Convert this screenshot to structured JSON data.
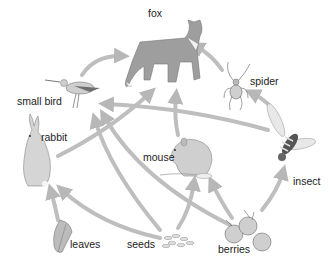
{
  "diagram": {
    "type": "food-web",
    "arrow_color": "#b4b4b4",
    "organism_fill": "#bdbdbd",
    "organisms": [
      {
        "id": "fox",
        "label": "fox",
        "role": "top predator"
      },
      {
        "id": "small_bird",
        "label": "small bird",
        "role": "consumer"
      },
      {
        "id": "spider",
        "label": "spider",
        "role": "consumer"
      },
      {
        "id": "rabbit",
        "label": "rabbit",
        "role": "herbivore"
      },
      {
        "id": "mouse",
        "label": "mouse",
        "role": "consumer"
      },
      {
        "id": "insect",
        "label": "insect",
        "role": "herbivore"
      },
      {
        "id": "leaves",
        "label": "leaves",
        "role": "producer"
      },
      {
        "id": "seeds",
        "label": "seeds",
        "role": "producer"
      },
      {
        "id": "berries",
        "label": "berries",
        "role": "producer"
      }
    ],
    "edges": [
      {
        "from": "small_bird",
        "to": "fox"
      },
      {
        "from": "spider",
        "to": "fox"
      },
      {
        "from": "rabbit",
        "to": "fox"
      },
      {
        "from": "mouse",
        "to": "fox"
      },
      {
        "from": "insect",
        "to": "spider"
      },
      {
        "from": "insect",
        "to": "small_bird"
      },
      {
        "from": "seeds",
        "to": "small_bird"
      },
      {
        "from": "berries",
        "to": "small_bird"
      },
      {
        "from": "leaves",
        "to": "rabbit"
      },
      {
        "from": "seeds",
        "to": "rabbit"
      },
      {
        "from": "seeds",
        "to": "mouse"
      },
      {
        "from": "berries",
        "to": "mouse"
      },
      {
        "from": "berries",
        "to": "insect"
      }
    ]
  }
}
